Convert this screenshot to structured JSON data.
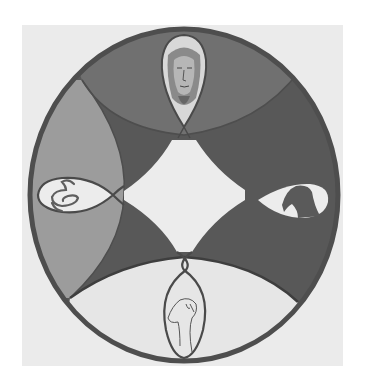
{
  "artwork": {
    "title": "Circular mandala drawing",
    "description": "Grayscale painted circle divided into four curved quadrants around a central white diamond, with four emblems: a human face (top), a coiled snake (left), a bird (right), and a bird head line-drawing (bottom).",
    "emblems": [
      {
        "position": "top",
        "subject": "human-face"
      },
      {
        "position": "left",
        "subject": "snake"
      },
      {
        "position": "right",
        "subject": "dark-bird"
      },
      {
        "position": "bottom",
        "subject": "bird-head-outline"
      }
    ],
    "colors": {
      "page": "#ffffff",
      "paper": "#ebebeb",
      "outline": "#4e4e4e",
      "dark": "#585858",
      "top_band": "#6f6f6f",
      "left_lens": "#9c9c9c",
      "bottom_band": "#e6e6e6",
      "center": "#ececec",
      "emblem_bg": "#eeeeee"
    }
  }
}
